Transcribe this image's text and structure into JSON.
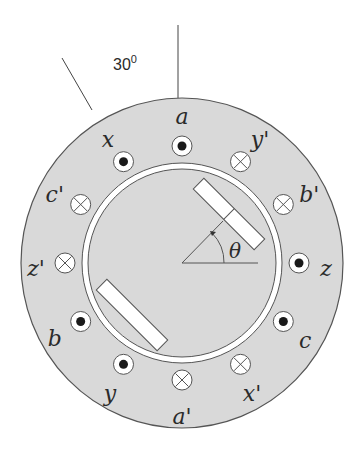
{
  "figure": {
    "title_angle_label": "30",
    "title_angle_degree_mark": "0",
    "rotor_angle_label": "θ",
    "colors": {
      "stator_fill": "#d9d9d9",
      "stroke": "#555555",
      "gap_fill": "#ffffff",
      "rotor_fill": "#d9d9d9",
      "bar_fill": "#ffffff",
      "dot_fill": "#1a1a1a"
    }
  },
  "conductors": [
    {
      "id": "a",
      "label": "a",
      "type": "dot",
      "angle_deg": 0
    },
    {
      "id": "y'",
      "label": "y'",
      "type": "cross",
      "angle_deg": 30
    },
    {
      "id": "b'",
      "label": "b'",
      "type": "cross",
      "angle_deg": 60
    },
    {
      "id": "z",
      "label": "z",
      "type": "dot",
      "angle_deg": 90
    },
    {
      "id": "c",
      "label": "c",
      "type": "dot",
      "angle_deg": 120
    },
    {
      "id": "x'",
      "label": "x'",
      "type": "cross",
      "angle_deg": 150
    },
    {
      "id": "a'",
      "label": "a'",
      "type": "cross",
      "angle_deg": 180
    },
    {
      "id": "y",
      "label": "y",
      "type": "dot",
      "angle_deg": 210
    },
    {
      "id": "b",
      "label": "b",
      "type": "dot",
      "angle_deg": 240
    },
    {
      "id": "z'",
      "label": "z'",
      "type": "cross",
      "angle_deg": 270
    },
    {
      "id": "c'",
      "label": "c'",
      "type": "cross",
      "angle_deg": 300
    },
    {
      "id": "x",
      "label": "x",
      "type": "dot",
      "angle_deg": 330
    }
  ]
}
